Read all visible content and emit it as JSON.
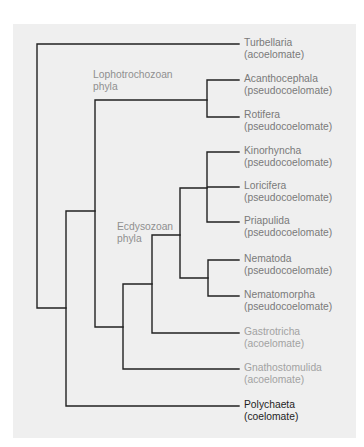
{
  "diagram": {
    "type": "phylogenetic-tree",
    "line_color": "#222222",
    "panel_color": "#efefef",
    "groups": [
      {
        "name": "Lophotrochozoan",
        "line2": "phyla"
      },
      {
        "name": "Ecdysozoan",
        "line2": "phyla"
      }
    ],
    "taxa": [
      {
        "name": "Turbellaria",
        "body_cavity": "(acoelomate)"
      },
      {
        "name": "Acanthocephala",
        "body_cavity": "(pseudocoelomate)"
      },
      {
        "name": "Rotifera",
        "body_cavity": "(pseudocoelomate)"
      },
      {
        "name": "Kinorhyncha",
        "body_cavity": "(pseudocoelomate)"
      },
      {
        "name": "Loricifera",
        "body_cavity": "(pseudocoelomate)"
      },
      {
        "name": "Priapulida",
        "body_cavity": "(pseudocoelomate)"
      },
      {
        "name": "Nematoda",
        "body_cavity": "(pseudocoelomate)"
      },
      {
        "name": "Nematomorpha",
        "body_cavity": "(pseudocoelomate)"
      },
      {
        "name": "Gastrotricha",
        "body_cavity": "(acoelomate)"
      },
      {
        "name": "Gnathostomulida",
        "body_cavity": "(acoelomate)"
      },
      {
        "name": "Polychaeta",
        "body_cavity": "(coelomate)"
      }
    ]
  }
}
